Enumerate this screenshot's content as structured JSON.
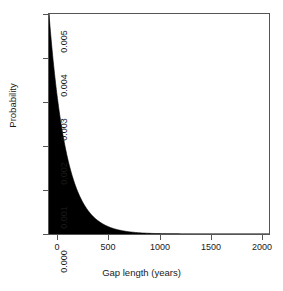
{
  "chart_data": {
    "type": "area",
    "title": "",
    "xlabel": "Gap length (years)",
    "ylabel": "Probability",
    "xlim": [
      0,
      2100
    ],
    "ylim": [
      0,
      0.005
    ],
    "grid": false,
    "legend": "none",
    "fill_color": "#000000",
    "axis_color": "#555555",
    "xticks": [
      0,
      500,
      1000,
      1500,
      2000
    ],
    "xtick_labels": [
      "0",
      "500",
      "1000",
      "1500",
      "2000"
    ],
    "yticks": [
      0.0,
      0.001,
      0.002,
      0.003,
      0.004,
      0.005
    ],
    "ytick_labels": [
      "0.000",
      "0.001",
      "0.002",
      "0.003",
      "0.004",
      "0.005"
    ],
    "model": "exponential",
    "rate": 0.006,
    "peak_value": 0.005,
    "x": [
      0,
      25,
      50,
      75,
      100,
      125,
      150,
      175,
      200,
      250,
      300,
      350,
      400,
      450,
      500,
      600,
      700,
      800,
      900,
      1000,
      1100,
      1200,
      1300,
      1400,
      1500,
      1600,
      1700,
      1800,
      1900,
      2000,
      2100
    ],
    "values": [
      0.005,
      0.0043,
      0.0037,
      0.00319,
      0.00274,
      0.00236,
      0.00203,
      0.00175,
      0.00151,
      0.00112,
      0.00083,
      0.00061,
      0.00045,
      0.00034,
      0.00025,
      0.000136,
      7.5e-05,
      4.1e-05,
      2.3e-05,
      1.24e-05,
      6.8e-06,
      3.7e-06,
      2.1e-06,
      1.1e-06,
      6e-07,
      3e-07,
      2e-07,
      1e-07,
      6e-08,
      3e-08,
      2e-08
    ]
  },
  "axes": {
    "x_title": "Gap length (years)",
    "y_title": "Probability"
  }
}
